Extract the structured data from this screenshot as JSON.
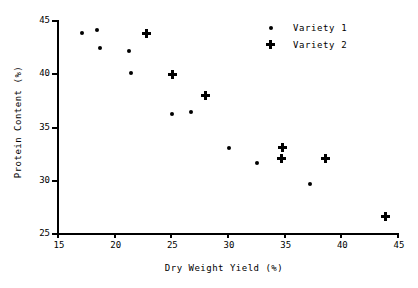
{
  "chart_data": {
    "type": "scatter",
    "title": "",
    "xlabel": "Dry Weight Yield (%)",
    "ylabel": "Protein Content (%)",
    "xlim": [
      15,
      45
    ],
    "ylim": [
      25,
      45
    ],
    "xticks": [
      15,
      20,
      25,
      30,
      35,
      40,
      45
    ],
    "yticks": [
      25,
      30,
      35,
      40,
      45
    ],
    "xtick_labels": [
      "15",
      "20",
      "25",
      "30",
      "35",
      "40",
      "45"
    ],
    "ytick_labels": [
      "25",
      "30",
      "35",
      "40",
      "45"
    ],
    "grid": false,
    "legend_position": "top-right",
    "series": [
      {
        "name": "Variety 1",
        "marker": "dot",
        "color": "#000000",
        "points": [
          {
            "x": 17.1,
            "y": 43.9
          },
          {
            "x": 18.4,
            "y": 44.2
          },
          {
            "x": 18.7,
            "y": 42.5
          },
          {
            "x": 21.3,
            "y": 42.2
          },
          {
            "x": 21.4,
            "y": 40.1
          },
          {
            "x": 25.1,
            "y": 36.3
          },
          {
            "x": 26.7,
            "y": 36.5
          },
          {
            "x": 30.1,
            "y": 33.1
          },
          {
            "x": 32.6,
            "y": 31.7
          },
          {
            "x": 37.2,
            "y": 29.7
          }
        ]
      },
      {
        "name": "Variety 2",
        "marker": "plus",
        "color": "#000000",
        "points": [
          {
            "x": 22.8,
            "y": 43.8
          },
          {
            "x": 25.1,
            "y": 40.0
          },
          {
            "x": 28.0,
            "y": 38.0
          },
          {
            "x": 34.8,
            "y": 33.1
          },
          {
            "x": 34.7,
            "y": 32.1
          },
          {
            "x": 38.6,
            "y": 32.1
          },
          {
            "x": 43.9,
            "y": 26.6
          }
        ]
      }
    ]
  },
  "legend": {
    "entries": [
      {
        "label": "Variety 1",
        "marker": "dot"
      },
      {
        "label": "Variety 2",
        "marker": "plus"
      }
    ]
  }
}
